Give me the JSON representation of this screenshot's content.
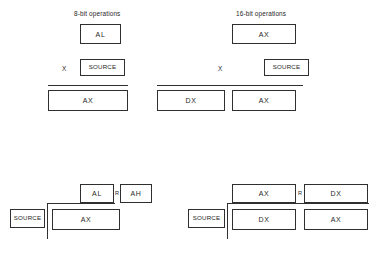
{
  "diagram": {
    "background_color": "#ffffff",
    "line_color": "#2f2f2f",
    "text_color": "#1f1f1f"
  },
  "sections": {
    "mul_8bit": {
      "caption": "8-bit operations",
      "operand_box": "AL",
      "operator": "X",
      "source_box": "SOURCE",
      "result_boxes": [
        "AX"
      ]
    },
    "mul_16bit": {
      "caption": "16-bit operations",
      "operand_box": "AX",
      "operator": "X",
      "source_box": "SOURCE",
      "result_boxes": [
        "DX",
        "AX"
      ]
    },
    "div_8bit": {
      "quotient_box": "AL",
      "remainder_label": "R",
      "remainder_box": "AH",
      "divisor_box": "SOURCE",
      "dividend_boxes": [
        "AX"
      ]
    },
    "div_16bit": {
      "quotient_box": "AX",
      "remainder_label": "R",
      "remainder_box": "DX",
      "divisor_box": "SOURCE",
      "dividend_boxes": [
        "DX",
        "AX"
      ]
    }
  }
}
